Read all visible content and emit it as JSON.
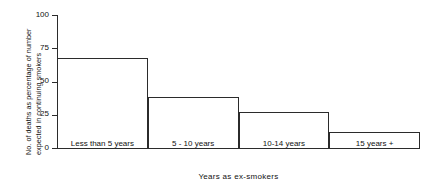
{
  "chart_data": {
    "type": "bar",
    "title": "",
    "subtitle": "",
    "xlabel": "Years as ex-smokers",
    "ylabel": "No. of deaths as percentage of number expected in continuing smokers",
    "ylabel_line1": "No. of deaths as percentage of number",
    "ylabel_line2": "expected in continuing smokers",
    "categories": [
      "Less than 5 years",
      "5 - 10 years",
      "10-14 years",
      "15 years +"
    ],
    "values": [
      68,
      38,
      27,
      12
    ],
    "ylim": [
      0,
      100
    ],
    "yticks": [
      0,
      25,
      50,
      75,
      100
    ],
    "ytick_labels": [
      "0",
      "25",
      "50",
      "75",
      "100"
    ],
    "grid": false,
    "legend": "none",
    "bar_style": {
      "fill": "#ffffff",
      "edge": "#2b2b2b",
      "adjacent": true
    },
    "annotations": []
  },
  "colors": {
    "background": "#ffffff",
    "axis": "#2b2b2b",
    "text": "#111111"
  }
}
